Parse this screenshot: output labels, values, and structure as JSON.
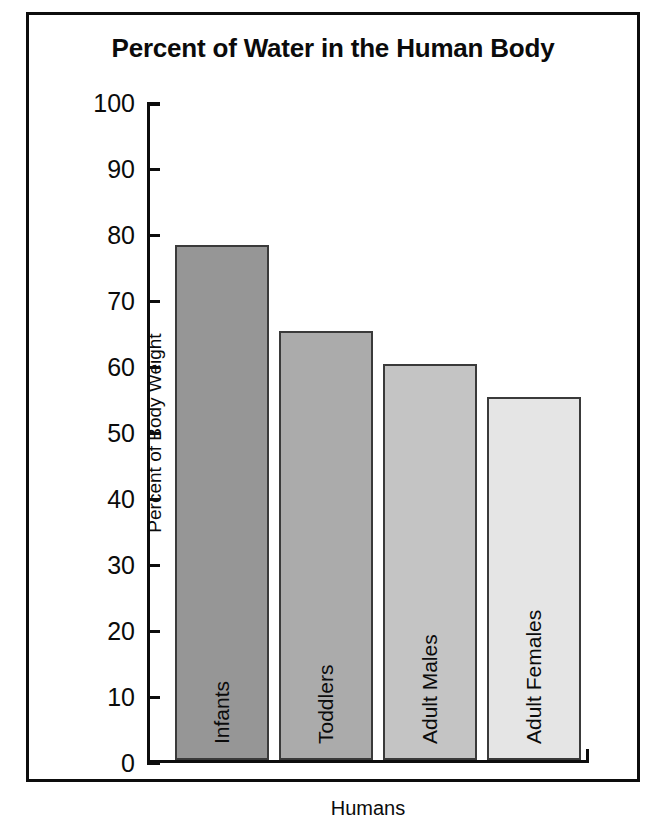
{
  "chart_data": {
    "type": "bar",
    "title": "Percent of Water in the Human Body",
    "xlabel": "Humans",
    "ylabel": "Percent of Body Weight",
    "categories": [
      "Infants",
      "Toddlers",
      "Adult Males",
      "Adult Females"
    ],
    "values": [
      78,
      65,
      60,
      55
    ],
    "ylim": [
      0,
      100
    ],
    "yticks": [
      0,
      10,
      20,
      30,
      40,
      50,
      60,
      70,
      80,
      90,
      100
    ],
    "ytick_labels": [
      "0",
      "10",
      "20",
      "30",
      "40",
      "50",
      "60",
      "70",
      "80",
      "90",
      "100"
    ],
    "grid": false,
    "legend": "none",
    "bar_colors": [
      "#969696",
      "#ababab",
      "#c4c4c4",
      "#e5e5e5"
    ],
    "bar_edge_color": "#3a3a3a",
    "axis_color": "#0d0d0d",
    "background": "#ffffff",
    "bars": [
      {
        "label": "Infants",
        "value": 78,
        "color": "#969696"
      },
      {
        "label": "Toddlers",
        "value": 65,
        "color": "#ababab"
      },
      {
        "label": "Adult Males",
        "value": 60,
        "color": "#c4c4c4"
      },
      {
        "label": "Adult Females",
        "value": 55,
        "color": "#e5e5e5"
      }
    ]
  }
}
